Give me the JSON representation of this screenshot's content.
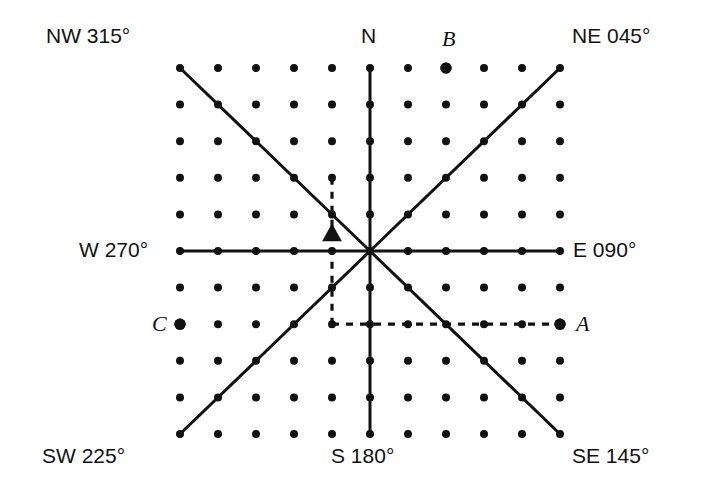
{
  "figure": {
    "background_color": "#ffffff",
    "ink_color": "#111111"
  },
  "chart_data": {
    "type": "scatter",
    "xlabel": "",
    "ylabel": "",
    "grid": {
      "columns": 11,
      "rows": 11,
      "x_min_px": 180,
      "x_max_px": 560,
      "y_min_px": 68,
      "y_max_px": 434,
      "col_spacing_px": 38,
      "row_spacing_px": 36.6,
      "dot_radius_px": 4,
      "dot_color": "#111111"
    },
    "center": {
      "col": 5,
      "row": 5,
      "x_px": 370,
      "y_px": 251
    },
    "bearing_lines": [
      {
        "name": "N",
        "bearing": 0,
        "from": {
          "col": 5,
          "row": 5
        },
        "to": {
          "col": 5,
          "row": 0
        },
        "style": "solid"
      },
      {
        "name": "NE",
        "bearing": 45,
        "from": {
          "col": 5,
          "row": 5
        },
        "to": {
          "col": 10,
          "row": 0
        },
        "style": "solid"
      },
      {
        "name": "E",
        "bearing": 90,
        "from": {
          "col": 5,
          "row": 5
        },
        "to": {
          "col": 10,
          "row": 5
        },
        "style": "solid"
      },
      {
        "name": "SE",
        "bearing": 145,
        "from": {
          "col": 5,
          "row": 5
        },
        "to": {
          "col": 10,
          "row": 10
        },
        "style": "solid"
      },
      {
        "name": "S",
        "bearing": 180,
        "from": {
          "col": 5,
          "row": 5
        },
        "to": {
          "col": 5,
          "row": 10
        },
        "style": "solid"
      },
      {
        "name": "SW",
        "bearing": 225,
        "from": {
          "col": 5,
          "row": 5
        },
        "to": {
          "col": 0,
          "row": 10
        },
        "style": "solid"
      },
      {
        "name": "W",
        "bearing": 270,
        "from": {
          "col": 5,
          "row": 5
        },
        "to": {
          "col": 0,
          "row": 5
        },
        "style": "solid"
      },
      {
        "name": "NW",
        "bearing": 315,
        "from": {
          "col": 5,
          "row": 5
        },
        "to": {
          "col": 0,
          "row": 0
        },
        "style": "solid"
      }
    ],
    "construction_lines": [
      {
        "name": "vertical-dashed",
        "from": {
          "col": 4,
          "row": 3
        },
        "to": {
          "col": 4,
          "row": 7
        },
        "style": "dashed"
      },
      {
        "name": "horizontal-dashed",
        "from": {
          "col": 4,
          "row": 7
        },
        "to": {
          "col": 10,
          "row": 7
        },
        "style": "dashed"
      }
    ],
    "marked_points": [
      {
        "label": "A",
        "col": 10,
        "row": 7,
        "emphasis": "large",
        "label_side": "right"
      },
      {
        "label": "B",
        "col": 7,
        "row": 0,
        "emphasis": "large",
        "label_side": "above"
      },
      {
        "label": "C",
        "col": 0,
        "row": 7,
        "emphasis": "large",
        "label_side": "left"
      }
    ],
    "markers": [
      {
        "name": "triangle-marker",
        "shape": "triangle",
        "x_px": 332,
        "y_px": 234,
        "size_px": 17
      }
    ]
  },
  "labels": {
    "nw": "NW 315°",
    "n": "N",
    "ne": "NE 045°",
    "w": "W 270°",
    "e": "E 090°",
    "sw": "SW 225°",
    "s": "S 180°",
    "se": "SE 145°",
    "point_a": "A",
    "point_b": "B",
    "point_c": "C"
  }
}
